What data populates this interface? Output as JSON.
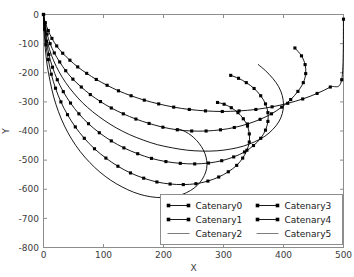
{
  "chart_data": {
    "type": "line",
    "title": "",
    "xlabel": "X",
    "ylabel": "Y",
    "xlim": [
      0,
      500
    ],
    "ylim": [
      -800,
      0
    ],
    "xticks": [
      0,
      100,
      200,
      300,
      400,
      500
    ],
    "yticks": [
      0,
      -100,
      -200,
      -300,
      -400,
      -500,
      -600,
      -700,
      -800
    ],
    "xtick_labels": [
      "0",
      "100",
      "200",
      "300",
      "400",
      "500"
    ],
    "ytick_labels": [
      "0",
      "-100",
      "-200",
      "-300",
      "-400",
      "-500",
      "-600",
      "-700",
      "-800"
    ],
    "grid": false,
    "legend_position": "lower right",
    "legend_ncol": 2,
    "series": [
      {
        "name": "Catenary0",
        "marker": "square",
        "linestyle": "solid",
        "color": "#000000",
        "points": [
          [
            0,
            0
          ],
          [
            3,
            -28
          ],
          [
            8,
            -55
          ],
          [
            14,
            -82
          ],
          [
            22,
            -108
          ],
          [
            32,
            -133
          ],
          [
            44,
            -157
          ],
          [
            57,
            -180
          ],
          [
            72,
            -202
          ],
          [
            88,
            -223
          ],
          [
            106,
            -243
          ],
          [
            125,
            -262
          ],
          [
            146,
            -279
          ],
          [
            168,
            -294
          ],
          [
            192,
            -307
          ],
          [
            217,
            -318
          ],
          [
            243,
            -326
          ],
          [
            270,
            -331
          ],
          [
            298,
            -333
          ],
          [
            326,
            -331
          ],
          [
            354,
            -326
          ],
          [
            381,
            -317
          ],
          [
            407,
            -305
          ],
          [
            432,
            -290
          ],
          [
            456,
            -271
          ],
          [
            478,
            -249
          ],
          [
            497,
            -224
          ],
          [
            500,
            -16
          ]
        ]
      },
      {
        "name": "Catenary1",
        "marker": "square",
        "linestyle": "solid",
        "color": "#000000",
        "points": [
          [
            0,
            0
          ],
          [
            2,
            -34
          ],
          [
            6,
            -67
          ],
          [
            11,
            -100
          ],
          [
            18,
            -132
          ],
          [
            27,
            -163
          ],
          [
            37,
            -193
          ],
          [
            49,
            -222
          ],
          [
            63,
            -249
          ],
          [
            78,
            -275
          ],
          [
            95,
            -299
          ],
          [
            113,
            -321
          ],
          [
            133,
            -341
          ],
          [
            154,
            -359
          ],
          [
            176,
            -374
          ],
          [
            199,
            -387
          ],
          [
            223,
            -396
          ],
          [
            247,
            -400
          ],
          [
            271,
            -400
          ],
          [
            295,
            -396
          ],
          [
            318,
            -388
          ],
          [
            340,
            -376
          ],
          [
            361,
            -360
          ],
          [
            380,
            -341
          ],
          [
            397,
            -318
          ],
          [
            412,
            -292
          ],
          [
            424,
            -264
          ],
          [
            433,
            -234
          ],
          [
            437,
            -203
          ],
          [
            436,
            -172
          ],
          [
            430,
            -142
          ],
          [
            419,
            -115
          ]
        ]
      },
      {
        "name": "Catenary2",
        "marker": "none",
        "linestyle": "solid",
        "color": "#4a4a4a",
        "points": [
          [
            0,
            0
          ],
          [
            2,
            -40
          ],
          [
            5,
            -80
          ],
          [
            10,
            -120
          ],
          [
            17,
            -159
          ],
          [
            26,
            -197
          ],
          [
            37,
            -234
          ],
          [
            50,
            -269
          ],
          [
            65,
            -303
          ],
          [
            82,
            -334
          ],
          [
            101,
            -363
          ],
          [
            121,
            -389
          ],
          [
            143,
            -412
          ],
          [
            166,
            -431
          ],
          [
            190,
            -447
          ],
          [
            215,
            -458
          ],
          [
            240,
            -466
          ],
          [
            265,
            -469
          ],
          [
            289,
            -468
          ],
          [
            312,
            -462
          ],
          [
            333,
            -452
          ],
          [
            352,
            -437
          ],
          [
            369,
            -418
          ],
          [
            382,
            -395
          ],
          [
            392,
            -369
          ],
          [
            398,
            -340
          ],
          [
            400,
            -310
          ],
          [
            398,
            -279
          ],
          [
            392,
            -248
          ],
          [
            382,
            -219
          ],
          [
            370,
            -193
          ],
          [
            358,
            -172
          ]
        ]
      },
      {
        "name": "Catenary3",
        "marker": "square",
        "linestyle": "solid",
        "color": "#000000",
        "points": [
          [
            0,
            0
          ],
          [
            2,
            -46
          ],
          [
            5,
            -92
          ],
          [
            9,
            -137
          ],
          [
            15,
            -181
          ],
          [
            23,
            -224
          ],
          [
            33,
            -265
          ],
          [
            45,
            -304
          ],
          [
            59,
            -341
          ],
          [
            75,
            -375
          ],
          [
            93,
            -406
          ],
          [
            113,
            -434
          ],
          [
            134,
            -458
          ],
          [
            157,
            -478
          ],
          [
            180,
            -494
          ],
          [
            204,
            -505
          ],
          [
            228,
            -511
          ],
          [
            252,
            -513
          ],
          [
            275,
            -510
          ],
          [
            297,
            -502
          ],
          [
            317,
            -489
          ],
          [
            335,
            -472
          ],
          [
            350,
            -450
          ],
          [
            362,
            -425
          ],
          [
            370,
            -397
          ],
          [
            374,
            -367
          ],
          [
            374,
            -337
          ],
          [
            370,
            -307
          ],
          [
            362,
            -279
          ],
          [
            351,
            -254
          ],
          [
            338,
            -234
          ],
          [
            325,
            -219
          ],
          [
            312,
            -209
          ]
        ]
      },
      {
        "name": "Catenary4",
        "marker": "square",
        "linestyle": "solid",
        "color": "#000000",
        "points": [
          [
            0,
            0
          ],
          [
            2,
            -52
          ],
          [
            4,
            -104
          ],
          [
            8,
            -155
          ],
          [
            13,
            -205
          ],
          [
            20,
            -253
          ],
          [
            29,
            -300
          ],
          [
            40,
            -344
          ],
          [
            53,
            -386
          ],
          [
            68,
            -425
          ],
          [
            85,
            -461
          ],
          [
            104,
            -493
          ],
          [
            124,
            -521
          ],
          [
            145,
            -544
          ],
          [
            167,
            -562
          ],
          [
            189,
            -575
          ],
          [
            211,
            -582
          ],
          [
            233,
            -584
          ],
          [
            254,
            -581
          ],
          [
            274,
            -572
          ],
          [
            292,
            -558
          ],
          [
            308,
            -540
          ],
          [
            322,
            -518
          ],
          [
            332,
            -493
          ],
          [
            339,
            -466
          ],
          [
            343,
            -438
          ],
          [
            343,
            -410
          ],
          [
            340,
            -383
          ],
          [
            333,
            -358
          ],
          [
            324,
            -337
          ],
          [
            313,
            -320
          ],
          [
            301,
            -308
          ],
          [
            290,
            -302
          ]
        ]
      },
      {
        "name": "Catenary5",
        "marker": "none",
        "linestyle": "solid",
        "color": "#4a4a4a",
        "points": [
          [
            0,
            0
          ],
          [
            1,
            -58
          ],
          [
            3,
            -116
          ],
          [
            6,
            -173
          ],
          [
            11,
            -229
          ],
          [
            17,
            -283
          ],
          [
            25,
            -334
          ],
          [
            35,
            -383
          ],
          [
            47,
            -428
          ],
          [
            61,
            -470
          ],
          [
            77,
            -508
          ],
          [
            94,
            -541
          ],
          [
            112,
            -569
          ],
          [
            131,
            -592
          ],
          [
            150,
            -610
          ],
          [
            169,
            -622
          ],
          [
            188,
            -628
          ],
          [
            206,
            -628
          ],
          [
            223,
            -623
          ],
          [
            238,
            -612
          ],
          [
            251,
            -596
          ],
          [
            261,
            -576
          ],
          [
            268,
            -553
          ],
          [
            272,
            -528
          ],
          [
            272,
            -502
          ],
          [
            269,
            -477
          ],
          [
            263,
            -453
          ],
          [
            255,
            -432
          ],
          [
            246,
            -415
          ],
          [
            237,
            -403
          ],
          [
            229,
            -396
          ],
          [
            224,
            -393
          ],
          [
            222,
            -392
          ]
        ]
      }
    ],
    "legend_entries": [
      {
        "label": "Catenary0",
        "marker": "square",
        "column": 0
      },
      {
        "label": "Catenary1",
        "marker": "square",
        "column": 0
      },
      {
        "label": "Catenary2",
        "marker": "none",
        "column": 0
      },
      {
        "label": "Catenary3",
        "marker": "square",
        "column": 1
      },
      {
        "label": "Catenary4",
        "marker": "square",
        "column": 1
      },
      {
        "label": "Catenary5",
        "marker": "none",
        "column": 1
      }
    ]
  },
  "colors": {
    "background": "#ffffff",
    "frame": "#8d8d8d",
    "curve": "#000000",
    "curve_plain": "#4a4a4a",
    "text": "#3c3c3c"
  }
}
